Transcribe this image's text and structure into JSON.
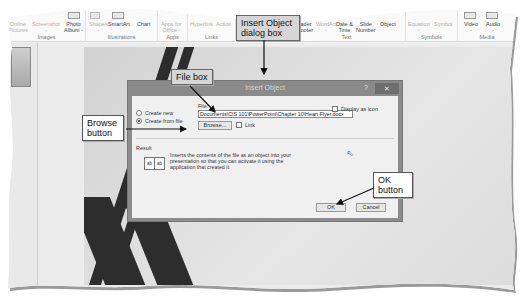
{
  "ribbon": {
    "groups": [
      {
        "label": "Images",
        "buttons": [
          {
            "label": "Online\nPictures",
            "disabled": true
          },
          {
            "label": "Screenshot\n-",
            "disabled": true
          },
          {
            "label": "Photo\nAlbum -",
            "disabled": false
          }
        ]
      },
      {
        "label": "Illustrations",
        "buttons": [
          {
            "label": "Shapes\n-",
            "disabled": true
          },
          {
            "label": "SmartArt",
            "disabled": false
          },
          {
            "label": "Chart",
            "disabled": false
          }
        ]
      },
      {
        "label": "Apps",
        "buttons": [
          {
            "label": "Apps for\nOffice -",
            "disabled": true
          }
        ]
      },
      {
        "label": "Links",
        "buttons": [
          {
            "label": "Hyperlink",
            "disabled": true
          },
          {
            "label": "Action",
            "disabled": true
          }
        ]
      },
      {
        "label": "Comments",
        "buttons": []
      },
      {
        "label": "Text",
        "buttons": [
          {
            "label": "Header\n& Footer",
            "disabled": false
          },
          {
            "label": "WordArt\n-",
            "disabled": true
          },
          {
            "label": "Date &\nTime",
            "disabled": false
          },
          {
            "label": "Slide\nNumber",
            "disabled": false
          },
          {
            "label": "Object",
            "disabled": false
          }
        ]
      },
      {
        "label": "Symbols",
        "buttons": [
          {
            "label": "Equation\n-",
            "disabled": true
          },
          {
            "label": "Symbol",
            "disabled": true
          }
        ]
      },
      {
        "label": "Media",
        "buttons": [
          {
            "label": "Video\n-",
            "disabled": false
          },
          {
            "label": "Audio\n-",
            "disabled": false
          }
        ]
      }
    ]
  },
  "dialog": {
    "title": "Insert Object",
    "help": "?",
    "close": "✕",
    "options": [
      {
        "label": "Create new",
        "selected": false
      },
      {
        "label": "Create from file",
        "selected": true
      }
    ],
    "file_label": "File:",
    "file_value": "Documents\\CIS 101\\PowerPoint\\Chapter 10\\Heart Flyer.docx",
    "browse_label": "Browse...",
    "link_label": "Link",
    "display_as_icon_label": "Display as icon",
    "result_label": "Result",
    "result_text": "Inserts the contents of the file as an object into your presentation so that you can activate it using the application that created it.",
    "result_icon_left": "ab",
    "result_icon_right": "ab",
    "ok_label": "OK",
    "cancel_label": "Cancel"
  },
  "callouts": {
    "insert_object": "Insert Object\ndialog box",
    "file_box": "File box",
    "browse_button": "Browse\nbutton",
    "ok_button": "OK\nbutton"
  },
  "colors": {
    "callout_shaded": "#d6d6d6",
    "dialog_titlebar": "#8a8a8a",
    "dialog_body": "#f0f0f0",
    "slide_stripe": "#2d2d2d"
  }
}
